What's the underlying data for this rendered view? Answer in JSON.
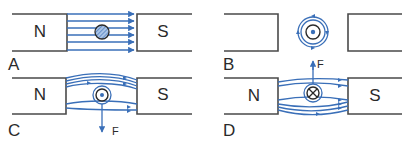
{
  "figure": {
    "colors": {
      "field_lines": "#3a6fb8",
      "magnet_outline": "#4a4a4a",
      "text": "#2a2a2a"
    },
    "panels": [
      {
        "id": "A",
        "label": "A",
        "left_pole": "N",
        "right_pole": "S",
        "conductor": "hatched (no current)",
        "field": "uniform, 6 parallel lines N to S"
      },
      {
        "id": "B",
        "label": "B",
        "left_pole": "",
        "right_pole": "",
        "conductor": "dot (current out of page)",
        "field": "concentric circles around conductor",
        "force_label": "F",
        "force_direction": "up"
      },
      {
        "id": "C",
        "label": "C",
        "left_pole": "N",
        "right_pole": "S",
        "conductor": "dot (current out of page)",
        "field": "combined field, crowded above",
        "force_label": "F",
        "force_direction": "down"
      },
      {
        "id": "D",
        "label": "D",
        "left_pole": "N",
        "right_pole": "S",
        "conductor": "cross (current into page)",
        "field": "combined field, crowded below",
        "force_label": "F",
        "force_direction": "up"
      }
    ]
  }
}
